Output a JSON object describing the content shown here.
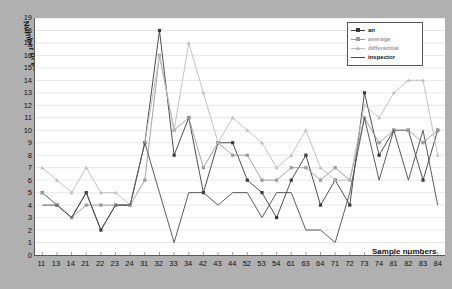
{
  "chart_data": {
    "type": "line",
    "title": "",
    "xlabel": "Sample numbers",
    "ylabel": "Number of points",
    "ylim": [
      0,
      19
    ],
    "yticks": [
      0,
      1,
      2,
      3,
      4,
      5,
      6,
      7,
      8,
      9,
      10,
      11,
      12,
      13,
      14,
      15,
      16,
      17,
      18,
      19
    ],
    "grid": true,
    "legend_position": "top-right",
    "categories": [
      "11",
      "13",
      "14",
      "21",
      "22",
      "23",
      "24",
      "31",
      "32",
      "33",
      "34",
      "42",
      "43",
      "44",
      "52",
      "53",
      "54",
      "61",
      "63",
      "64",
      "71",
      "72",
      "73",
      "74",
      "81",
      "82",
      "83",
      "84"
    ],
    "series": [
      {
        "name": "an",
        "color": "#3a3a3a",
        "marker": "square",
        "values": [
          5,
          4,
          3,
          5,
          2,
          4,
          4,
          9,
          18,
          8,
          11,
          5,
          9,
          9,
          6,
          5,
          3,
          6,
          8,
          4,
          6,
          4,
          13,
          8,
          10,
          10,
          6,
          10
        ]
      },
      {
        "name": "average",
        "color": "#9a9a9a",
        "marker": "square",
        "values": [
          5,
          4,
          3,
          4,
          4,
          4,
          4,
          6,
          16,
          10,
          11,
          7,
          9,
          8,
          8,
          6,
          6,
          7,
          7,
          6,
          7,
          6,
          11,
          9,
          10,
          10,
          9,
          10
        ]
      },
      {
        "name": "differential",
        "color": "#bcbcbc",
        "marker": "triangle",
        "values": [
          7,
          6,
          5,
          7,
          5,
          5,
          4,
          9,
          16,
          10,
          17,
          13,
          9,
          11,
          10,
          9,
          7,
          8,
          10,
          7,
          6,
          6,
          12,
          11,
          13,
          14,
          14,
          8
        ]
      },
      {
        "name": "inspector",
        "color": "#4a4a4a",
        "marker": "none",
        "values": [
          4,
          4,
          3,
          5,
          2,
          4,
          4,
          9,
          5,
          1,
          5,
          5,
          4,
          5,
          5,
          3,
          5,
          5,
          2,
          2,
          1,
          5,
          11,
          6,
          10,
          6,
          10,
          4
        ]
      }
    ]
  },
  "legend": {
    "items": [
      {
        "label": "an"
      },
      {
        "label": "average"
      },
      {
        "label": "differential"
      },
      {
        "label": "inspector"
      }
    ]
  }
}
